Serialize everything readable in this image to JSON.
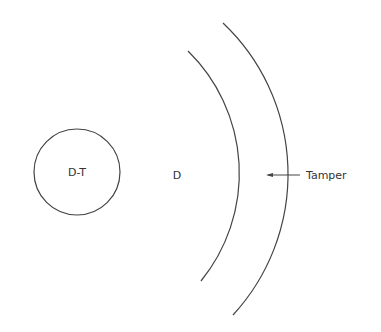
{
  "diagram": {
    "core_label": "D-T",
    "fuel_label": "D",
    "tamper_label": "Tamper",
    "stroke_color": "#444444",
    "text_color": "#333333"
  }
}
